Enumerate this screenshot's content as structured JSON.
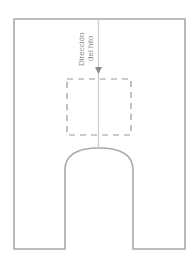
{
  "diagram": {
    "type": "sewing-pattern-piece",
    "grain_label": {
      "line1": "Dirección",
      "line2": "del hilo"
    },
    "colors": {
      "outline": "#a8a8a8",
      "grain_line": "#cccccc",
      "dashed_box": "#9a9a9a",
      "arrow": "#8a8a8a",
      "text": "#8c8c8c",
      "background": "#ffffff"
    }
  }
}
